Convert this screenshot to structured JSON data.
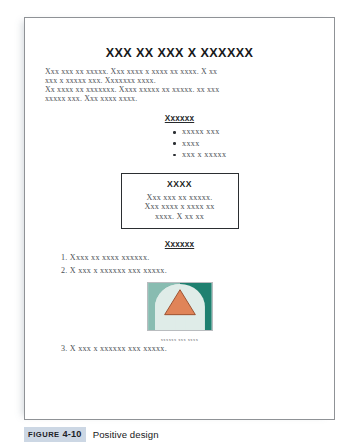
{
  "document": {
    "title": "XXX XX XXX X XXXXXX",
    "paragraph_lines": [
      "Xxx xxx xx xxxxx. Xxx xxxx x xxxx xx xxxx. X xx",
      "xxx x xxxxx xxx. Xxxxxxx xxxx.",
      "Xx xxxx xx xxxxxxx. Xxxx xxxxx xx xxxxx.  xx xxx",
      "xxxxx xxx. Xxx xxxx xxxx."
    ],
    "bullet_heading": "Xxxxxx",
    "bullets": [
      "xxxxx xxx",
      "xxxx",
      "xxx x xxxxx"
    ],
    "callout": {
      "title": "XXXX",
      "lines": [
        "Xxx xxx xx xxxxx.",
        "Xxx xxxx x xxxx xx",
        "xxxx. X xx xx"
      ]
    },
    "list_heading": "Xxxxxx",
    "numbered_items": [
      "1. Xxxx xx xxxx xxxxxx.",
      "2. X xxx x xxxxxx xxx xxxxx.",
      "3. X xxx x xxxxxx xxx xxxxx."
    ],
    "graphic": {
      "name": "triangle-dome-graphic",
      "caption": "xxxxxx xxx xxxx",
      "colors": {
        "background": "#1f8070",
        "dome": "#dfece8",
        "triangle": "#e08458",
        "triangle_outline": "#9a4e2d",
        "frame": "#b9bcbf"
      }
    }
  },
  "figure_caption": {
    "label_word": "FIGURE",
    "label_number": "4-10",
    "title": "Positive design",
    "highlight_color": "#ccd7e4"
  }
}
